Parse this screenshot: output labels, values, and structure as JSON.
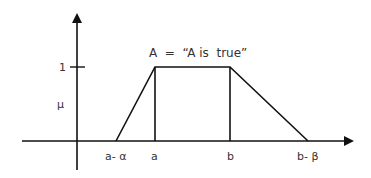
{
  "diagram": {
    "type": "trapezoidal-membership-function",
    "title": "A  =  “A is  true”",
    "y_axis_label": "μ",
    "y_tick_label": "1",
    "x_labels": {
      "a_minus_alpha": "a- α",
      "a": "a",
      "b": "b",
      "b_minus_beta": "b- β"
    },
    "colors": {
      "line": "#111111",
      "text": "#333333",
      "background": "#ffffff"
    }
  }
}
